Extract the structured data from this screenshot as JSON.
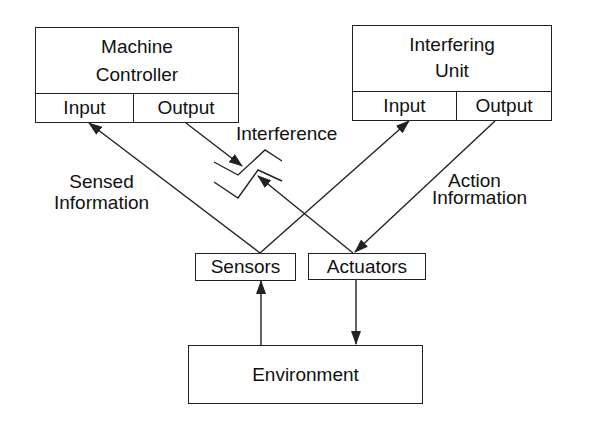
{
  "diagram": {
    "machine_controller": {
      "title_line1": "Machine",
      "title_line2": "Controller",
      "input_label": "Input",
      "output_label": "Output"
    },
    "interfering_unit": {
      "title_line1": "Interfering",
      "title_line2": "Unit",
      "input_label": "Input",
      "output_label": "Output"
    },
    "sensors": {
      "label": "Sensors"
    },
    "actuators": {
      "label": "Actuators"
    },
    "environment": {
      "label": "Environment"
    },
    "labels": {
      "interference": "Interference",
      "sensed_line1": "Sensed",
      "sensed_line2": "Information",
      "action_line1": "Action",
      "action_line2": "Information"
    },
    "edges": [
      {
        "from": "sensors",
        "to": "machine_controller.input",
        "label": "Sensed Information"
      },
      {
        "from": "sensors",
        "to": "interfering_unit.input"
      },
      {
        "from": "machine_controller.output",
        "to": "interference"
      },
      {
        "from": "actuators",
        "to": "interference"
      },
      {
        "from": "interfering_unit.output",
        "to": "actuators",
        "label": "Action Information"
      },
      {
        "from": "environment",
        "to": "sensors"
      },
      {
        "from": "actuators",
        "to": "environment"
      }
    ],
    "colors": {
      "line": "#222222",
      "background": "#ffffff"
    }
  }
}
